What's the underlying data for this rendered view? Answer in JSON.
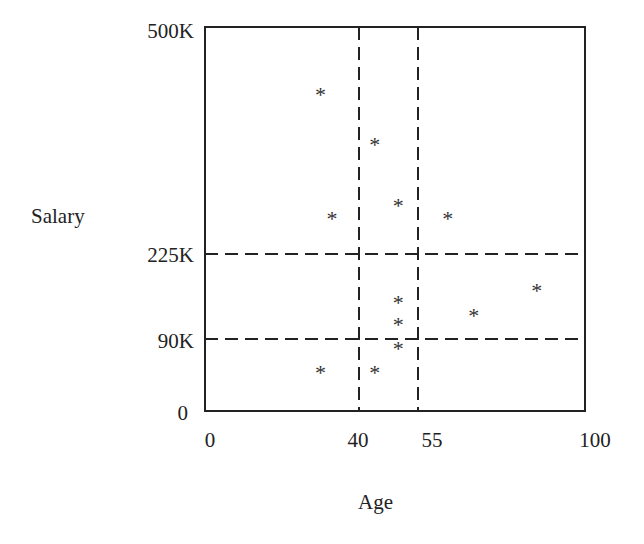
{
  "chart_data": {
    "type": "scatter",
    "title": "",
    "xlabel": "Age",
    "ylabel": "Salary",
    "marker": "*",
    "x_ticks": [
      0,
      40,
      55,
      100
    ],
    "x_tick_labels": [
      "0",
      "40",
      "55",
      "100"
    ],
    "y_ticks": [
      0,
      90000,
      225000,
      500000
    ],
    "y_tick_labels": [
      "0",
      "90K",
      "225K",
      "500K"
    ],
    "xlim": [
      0,
      100
    ],
    "ylim": [
      0,
      500000
    ],
    "axis_scale_note": "tick positions are not linearly spaced (partition boundaries emphasized)",
    "partition_lines": {
      "vertical_age": [
        40,
        55
      ],
      "horizontal_salary": [
        90000,
        225000
      ],
      "style": "dashed"
    },
    "points": [
      {
        "age": 30,
        "salary": 420000
      },
      {
        "age": 44,
        "salary": 360000
      },
      {
        "age": 33,
        "salary": 270000
      },
      {
        "age": 50,
        "salary": 285000
      },
      {
        "age": 63,
        "salary": 270000
      },
      {
        "age": 87,
        "salary": 170000
      },
      {
        "age": 50,
        "salary": 150000
      },
      {
        "age": 70,
        "salary": 130000
      },
      {
        "age": 50,
        "salary": 115000
      },
      {
        "age": 50,
        "salary": 80000
      },
      {
        "age": 30,
        "salary": 50000
      },
      {
        "age": 44,
        "salary": 50000
      }
    ],
    "grid": false,
    "legend": null
  },
  "labels": {
    "ylabel": "Salary",
    "xlabel": "Age",
    "y_ticks": [
      "500K",
      "225K",
      "90K",
      "0"
    ],
    "x_ticks": [
      "0",
      "40",
      "55",
      "100"
    ]
  },
  "layout_px": {
    "plot_left": 205,
    "plot_top": 27,
    "plot_right": 585,
    "plot_bottom": 411,
    "x_map": [
      [
        0,
        205
      ],
      [
        40,
        359
      ],
      [
        55,
        418
      ],
      [
        100,
        585
      ]
    ],
    "y_map": [
      [
        0,
        411
      ],
      [
        90000,
        339
      ],
      [
        225000,
        254
      ],
      [
        500000,
        27
      ]
    ]
  }
}
